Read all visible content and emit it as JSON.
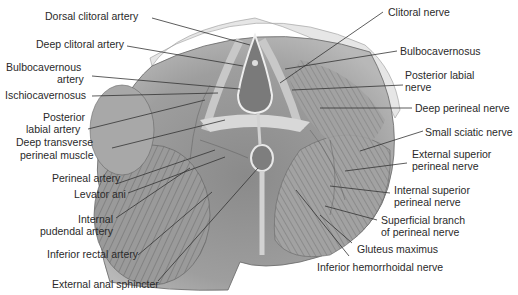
{
  "figure": {
    "labels_left": [
      {
        "id": "dorsal-clitoral-artery",
        "text": "Dorsal clitoral artery",
        "x": 45,
        "y": 10
      },
      {
        "id": "deep-clitoral-artery",
        "text": "Deep clitoral artery",
        "x": 36,
        "y": 38
      },
      {
        "id": "bulbocavernous-artery-1",
        "text": "Bulbocavernous",
        "x": 6,
        "y": 61
      },
      {
        "id": "bulbocavernous-artery-2",
        "text": "artery",
        "x": 57,
        "y": 74
      },
      {
        "id": "ischiocavernosus",
        "text": "Ischiocavernosus",
        "x": 5,
        "y": 89
      },
      {
        "id": "posterior-labial-artery-1",
        "text": "Posterior",
        "x": 43,
        "y": 111
      },
      {
        "id": "posterior-labial-artery-2",
        "text": "labial artery",
        "x": 26,
        "y": 124
      },
      {
        "id": "deep-transverse-perineal-1",
        "text": "Deep transverse",
        "x": 16,
        "y": 137
      },
      {
        "id": "deep-transverse-perineal-2",
        "text": "perineal muscle",
        "x": 20,
        "y": 150
      },
      {
        "id": "perineal-artery",
        "text": "Perineal artery",
        "x": 52,
        "y": 172
      },
      {
        "id": "levator-ani",
        "text": "Levator ani",
        "x": 74,
        "y": 188
      },
      {
        "id": "internal-pudendal-artery-1",
        "text": "Internal",
        "x": 78,
        "y": 213
      },
      {
        "id": "internal-pudendal-artery-2",
        "text": "pudendal artery",
        "x": 40,
        "y": 226
      },
      {
        "id": "inferior-rectal-artery",
        "text": "Inferior rectal artery",
        "x": 47,
        "y": 249
      },
      {
        "id": "external-anal-sphincter",
        "text": "External anal sphincter",
        "x": 52,
        "y": 279
      }
    ],
    "labels_right": [
      {
        "id": "clitoral-nerve",
        "text": "Clitoral nerve",
        "x": 388,
        "y": 6
      },
      {
        "id": "bulbocavernosus",
        "text": "Bulbocavernosus",
        "x": 400,
        "y": 45
      },
      {
        "id": "posterior-labial-nerve-1",
        "text": "Posterior labial",
        "x": 405,
        "y": 70
      },
      {
        "id": "posterior-labial-nerve-2",
        "text": "nerve",
        "x": 405,
        "y": 82
      },
      {
        "id": "deep-perineal-nerve",
        "text": "Deep perineal nerve",
        "x": 415,
        "y": 102
      },
      {
        "id": "small-sciatic-nerve",
        "text": "Small sciatic nerve",
        "x": 425,
        "y": 127
      },
      {
        "id": "external-superior-perineal-nerve-1",
        "text": "External superior",
        "x": 412,
        "y": 148
      },
      {
        "id": "external-superior-perineal-nerve-2",
        "text": "perineal nerve",
        "x": 412,
        "y": 160
      },
      {
        "id": "internal-superior-perineal-nerve-1",
        "text": "Internal superior",
        "x": 394,
        "y": 184
      },
      {
        "id": "internal-superior-perineal-nerve-2",
        "text": "perineal nerve",
        "x": 394,
        "y": 196
      },
      {
        "id": "superficial-branch-perineal-nerve-1",
        "text": "Superficial branch",
        "x": 381,
        "y": 214
      },
      {
        "id": "superficial-branch-perineal-nerve-2",
        "text": "of perineal nerve",
        "x": 381,
        "y": 226
      },
      {
        "id": "gluteus-maximus",
        "text": "Gluteus maximus",
        "x": 357,
        "y": 243
      },
      {
        "id": "inferior-hemorrhoidal-nerve",
        "text": "Inferior hemorrhoidal nerve",
        "x": 317,
        "y": 262
      }
    ]
  },
  "colors": {
    "background": "#ffffff",
    "text": "#2a2a2a",
    "leader": "#333333",
    "muscle_dark": "#6e6e6e",
    "muscle_mid": "#9a9a9a",
    "muscle_light": "#c4c4c4",
    "fat": "#e4e4e4"
  }
}
